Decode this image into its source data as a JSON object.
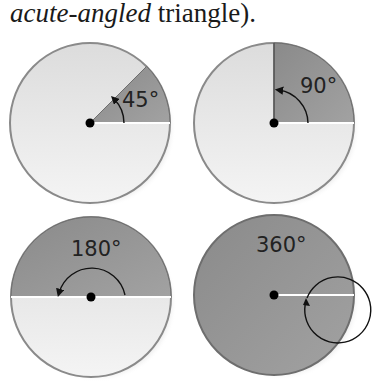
{
  "caption": {
    "italic": "acute-angled",
    "rest": " triangle)."
  },
  "diagrams": [
    {
      "label": "45°",
      "angle": 45
    },
    {
      "label": "90°",
      "angle": 90
    },
    {
      "label": "180°",
      "angle": 180
    },
    {
      "label": "360°",
      "angle": 360
    }
  ],
  "colors": {
    "disc_light": "#e6e6e6",
    "sector_dark": "#8f8f8f",
    "rim": "#6e6e6e",
    "arrow": "#111111"
  }
}
